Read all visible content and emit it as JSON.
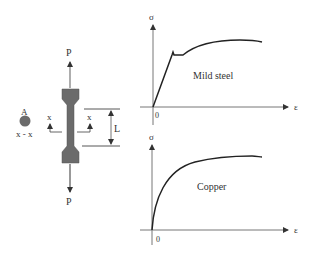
{
  "specimen": {
    "load_top_label": "P",
    "load_bottom_label": "P",
    "gauge_length_label": "L",
    "section_marker_left": "x",
    "section_marker_right": "x",
    "cross_section_area_label": "A",
    "cross_section_caption": "x - x",
    "colors": {
      "specimen_fill": "#6b6b6b",
      "arrow": "#555555"
    }
  },
  "graphs": [
    {
      "material": "Mild steel",
      "y_axis_label": "σ",
      "x_axis_label": "ε",
      "origin_label": "0",
      "curve_shape": "linear elastic, yield drop, plateau, strain hardening"
    },
    {
      "material": "Copper",
      "y_axis_label": "σ",
      "x_axis_label": "ε",
      "origin_label": "0",
      "curve_shape": "nonlinear, no distinct yield point"
    }
  ]
}
